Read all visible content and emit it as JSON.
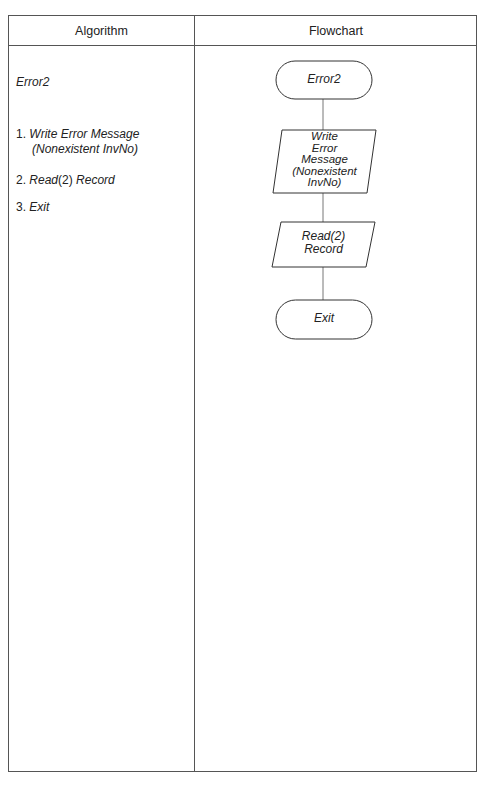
{
  "table": {
    "headers": [
      "Algorithm",
      "Flowchart"
    ]
  },
  "algorithm": {
    "title": "Error2",
    "steps": [
      {
        "number": "1.",
        "text": "Write Error Message",
        "continuation": "(Nonexistent InvNo)"
      },
      {
        "number": "2.",
        "text_prefix": "Read",
        "text_paren": "(2)",
        "text_suffix": " Record"
      },
      {
        "number": "3.",
        "text": "Exit"
      }
    ]
  },
  "flowchart": {
    "nodes": [
      {
        "id": "start",
        "shape": "terminator",
        "label": "Error2"
      },
      {
        "id": "write",
        "shape": "parallelogram",
        "label_lines": [
          "Write",
          "Error",
          "Message",
          "(Nonexistent",
          "InvNo)"
        ]
      },
      {
        "id": "read",
        "shape": "parallelogram",
        "label_lines": [
          "Read(2)",
          "Record"
        ]
      },
      {
        "id": "exit",
        "shape": "terminator",
        "label": "Exit"
      }
    ],
    "edges": [
      {
        "from": "start",
        "to": "write"
      },
      {
        "from": "write",
        "to": "read"
      },
      {
        "from": "read",
        "to": "exit"
      }
    ]
  }
}
